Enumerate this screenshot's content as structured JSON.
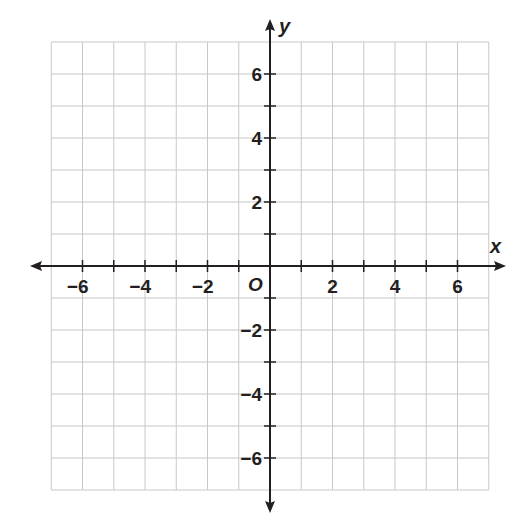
{
  "chart_data": {
    "type": "coordinate-grid",
    "title": "",
    "xlabel": "x",
    "ylabel": "y",
    "origin_label": "O",
    "xlim": [
      -7,
      7
    ],
    "ylim": [
      -7,
      7
    ],
    "grid": true,
    "grid_step": 1,
    "x_ticks": [
      -6,
      -4,
      -2,
      2,
      4,
      6
    ],
    "y_ticks": [
      -6,
      -4,
      -2,
      2,
      4,
      6
    ],
    "x_tick_labels": [
      "−6",
      "−4",
      "−2",
      "2",
      "4",
      "6"
    ],
    "y_tick_labels": [
      "−6",
      "−4",
      "−2",
      "2",
      "4",
      "6"
    ],
    "series": []
  },
  "colors": {
    "grid": "#c8c8c8",
    "axis": "#231f20",
    "background": "#ffffff"
  }
}
